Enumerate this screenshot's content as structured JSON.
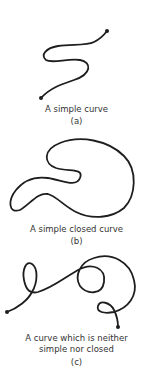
{
  "panels": [
    {
      "id": "a",
      "caption": "A simple curve",
      "sublabel": "(a)"
    },
    {
      "id": "b",
      "caption": "A simple closed curve",
      "sublabel": "(b)"
    },
    {
      "id": "c",
      "caption_line1": "A curve which is neither",
      "caption_line2": "simple nor closed",
      "sublabel": "(c)"
    }
  ],
  "colors": {
    "stroke": "#1e1e1e",
    "text": "#333333",
    "background": "#ffffff"
  }
}
